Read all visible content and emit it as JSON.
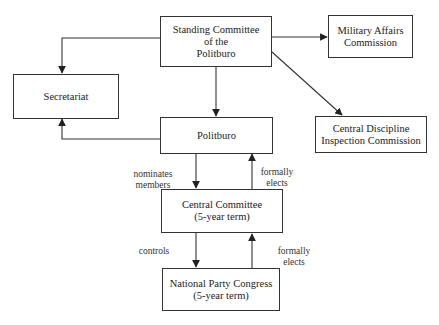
{
  "diagram": {
    "nodes": {
      "standing_committee": {
        "lines": [
          "Standing Committee",
          "of the",
          "Politburo"
        ]
      },
      "military_affairs": {
        "lines": [
          "Military Affairs",
          "Commission"
        ]
      },
      "secretariat": {
        "lines": [
          "Secretariat"
        ]
      },
      "politburo": {
        "lines": [
          "Politburo"
        ]
      },
      "central_discipline": {
        "lines": [
          "Central Discipline",
          "Inspection Commission"
        ]
      },
      "central_committee": {
        "lines": [
          "Central Committee",
          "(5-year term)"
        ]
      },
      "national_party_congress": {
        "lines": [
          "National Party Congress",
          "(5-year term)"
        ]
      }
    },
    "edge_labels": {
      "nominates": [
        "nominates",
        "members"
      ],
      "elects_politburo": [
        "formally",
        "elects"
      ],
      "controls": [
        "controls"
      ],
      "elects_cc": [
        "formally",
        "elects"
      ]
    },
    "edges": [
      {
        "from": "standing_committee",
        "to": "secretariat",
        "label": ""
      },
      {
        "from": "standing_committee",
        "to": "military_affairs",
        "label": ""
      },
      {
        "from": "standing_committee",
        "to": "central_discipline",
        "label": ""
      },
      {
        "from": "standing_committee",
        "to": "politburo",
        "label": ""
      },
      {
        "from": "politburo",
        "to": "secretariat",
        "label": ""
      },
      {
        "from": "politburo",
        "to": "central_committee",
        "label": "nominates members"
      },
      {
        "from": "central_committee",
        "to": "politburo",
        "label": "formally elects"
      },
      {
        "from": "central_committee",
        "to": "national_party_congress",
        "label": "controls"
      },
      {
        "from": "national_party_congress",
        "to": "central_committee",
        "label": "formally elects"
      }
    ]
  }
}
